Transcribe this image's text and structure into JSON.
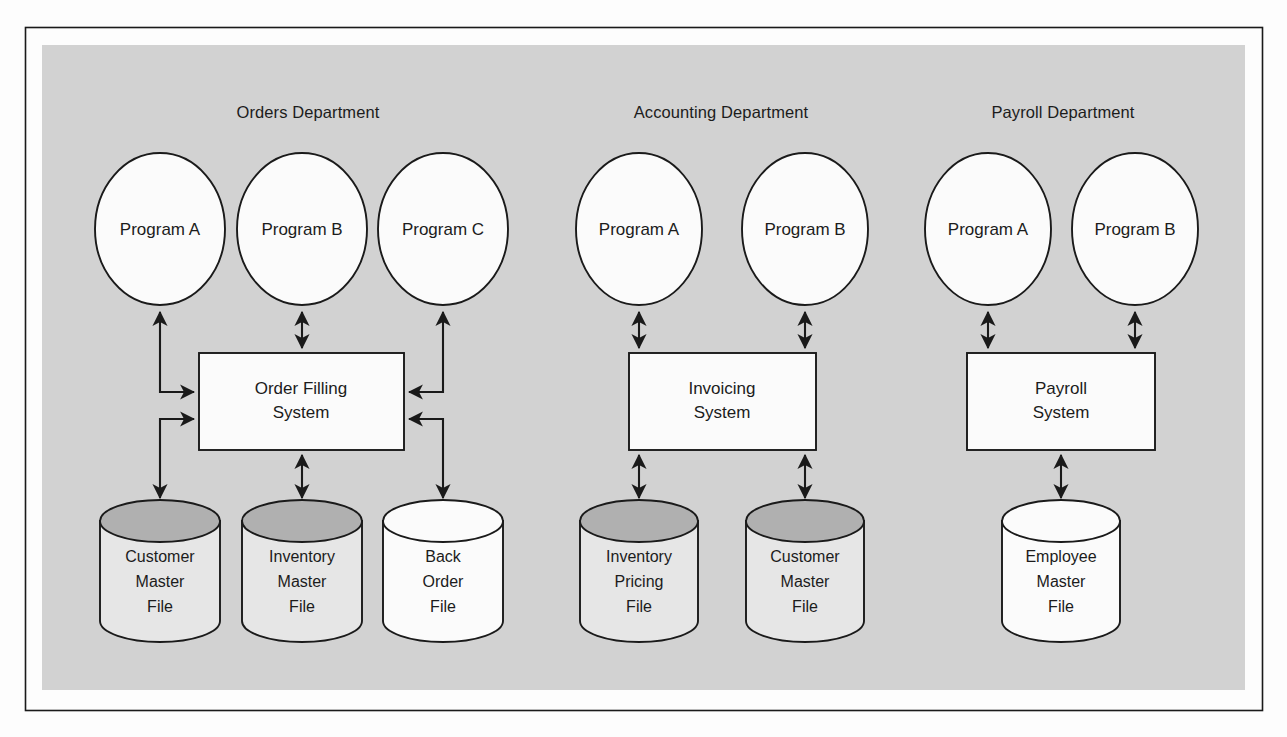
{
  "figure": {
    "background_color": "#fdfdfd",
    "panel_color": "#d2d2d2",
    "border_color": "#1a1a1a",
    "shape_fill_white": "#fbfbfb",
    "shape_fill_light": "#e6e6e6",
    "cylinder_top_shaded": "#b0b0b0",
    "cylinder_top_plain": "#fbfbfb",
    "line_color": "#1a1a1a"
  },
  "departments": [
    {
      "id": "orders",
      "title": "Orders Department",
      "programs": [
        {
          "label": "Program A"
        },
        {
          "label": "Program B"
        },
        {
          "label": "Program C"
        }
      ],
      "system": {
        "line1": "Order Filling",
        "line2": "System"
      },
      "files": [
        {
          "lines": [
            "Customer",
            "Master",
            "File"
          ],
          "top_shaded": true
        },
        {
          "lines": [
            "Inventory",
            "Master",
            "File"
          ],
          "top_shaded": true
        },
        {
          "lines": [
            "Back",
            "Order",
            "File"
          ],
          "top_shaded": false
        }
      ]
    },
    {
      "id": "accounting",
      "title": "Accounting Department",
      "programs": [
        {
          "label": "Program A"
        },
        {
          "label": "Program B"
        }
      ],
      "system": {
        "line1": "Invoicing",
        "line2": "System"
      },
      "files": [
        {
          "lines": [
            "Inventory",
            "Pricing",
            "File"
          ],
          "top_shaded": true
        },
        {
          "lines": [
            "Customer",
            "Master",
            "File"
          ],
          "top_shaded": true
        }
      ]
    },
    {
      "id": "payroll",
      "title": "Payroll Department",
      "programs": [
        {
          "label": "Program A"
        },
        {
          "label": "Program B"
        }
      ],
      "system": {
        "line1": "Payroll",
        "line2": "System"
      },
      "files": [
        {
          "lines": [
            "Employee",
            "Master",
            "File"
          ],
          "top_shaded": false
        }
      ]
    }
  ]
}
